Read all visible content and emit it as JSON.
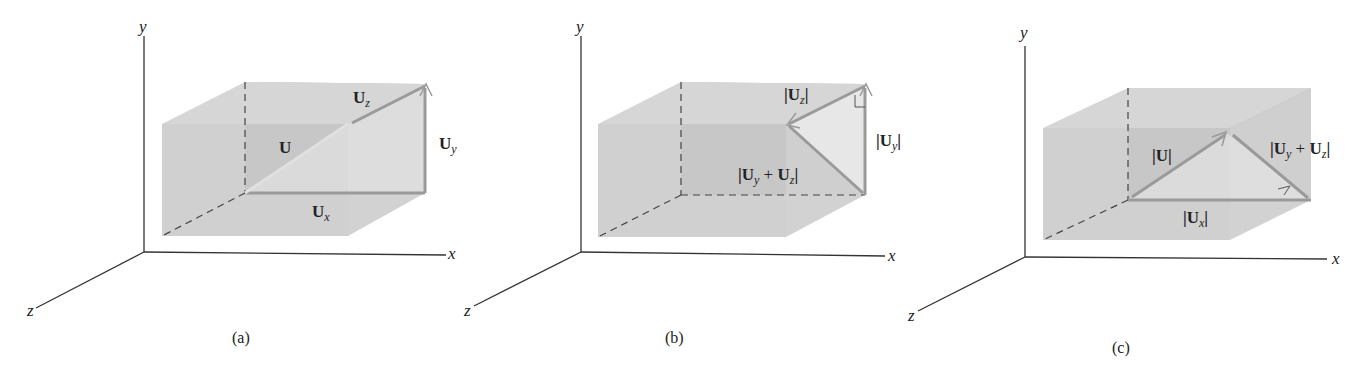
{
  "figure": {
    "panels": [
      {
        "id": "a",
        "caption": "(a)",
        "axes": {
          "x": "x",
          "y": "y",
          "z": "z"
        },
        "vectors": [
          {
            "name": "U",
            "label_base": "U",
            "label_sub": "",
            "magnitude": false
          },
          {
            "name": "Ux",
            "label_base": "U",
            "label_sub": "x",
            "magnitude": false
          },
          {
            "name": "Uy",
            "label_base": "U",
            "label_sub": "y",
            "magnitude": false
          },
          {
            "name": "Uz",
            "label_base": "U",
            "label_sub": "z",
            "magnitude": false
          }
        ]
      },
      {
        "id": "b",
        "caption": "(b)",
        "axes": {
          "x": "x",
          "y": "y",
          "z": "z"
        },
        "labels": {
          "uz": {
            "open": "|",
            "base": "U",
            "sub": "z",
            "close": "|"
          },
          "uy": {
            "open": "|",
            "base": "U",
            "sub": "y",
            "close": "|"
          },
          "uyz": {
            "open": "|",
            "base1": "U",
            "sub1": "y",
            "plus": " + ",
            "base2": "U",
            "sub2": "z",
            "close": "|"
          }
        },
        "right_angle_marker": true
      },
      {
        "id": "c",
        "caption": "(c)",
        "axes": {
          "x": "x",
          "y": "y",
          "z": "z"
        },
        "labels": {
          "u": {
            "open": "|",
            "base": "U",
            "close": "|"
          },
          "ux": {
            "open": "|",
            "base": "U",
            "sub": "x",
            "close": "|"
          },
          "uyz": {
            "open": "|",
            "base1": "U",
            "sub1": "y",
            "plus": " + ",
            "base2": "U",
            "sub2": "z",
            "close": "|"
          }
        },
        "right_angle_marker": true
      }
    ],
    "colors": {
      "box_front": "#c9c9c9",
      "box_top": "#d9d9d9",
      "box_side": "#d2d2d2",
      "box_back": "#bdbdbd",
      "vector": "#9a9a9a",
      "axis": "#333333",
      "dashed": "#444444"
    }
  }
}
